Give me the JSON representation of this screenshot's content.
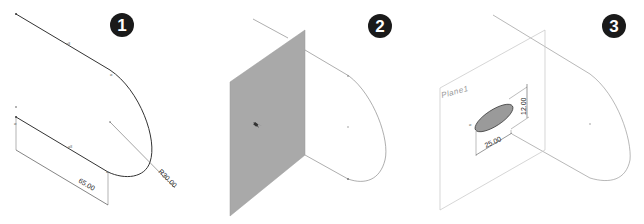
{
  "steps": [
    {
      "number": "1",
      "description": "3D sketch path with dimensions",
      "dimensions": {
        "radius": "R30.00",
        "length": "65.00"
      }
    },
    {
      "number": "2",
      "description": "Plane inserted normal to path",
      "plane_color": "#a9a9a9"
    },
    {
      "number": "3",
      "description": "Ellipse sketched on plane",
      "plane_label": "Plane1",
      "dimensions": {
        "major": "25.00",
        "minor": "12.00"
      },
      "ellipse_fill": "#9a9a9a"
    }
  ],
  "colors": {
    "badge": "#1a1a1a",
    "line": "#333333",
    "light_line": "#777777"
  }
}
